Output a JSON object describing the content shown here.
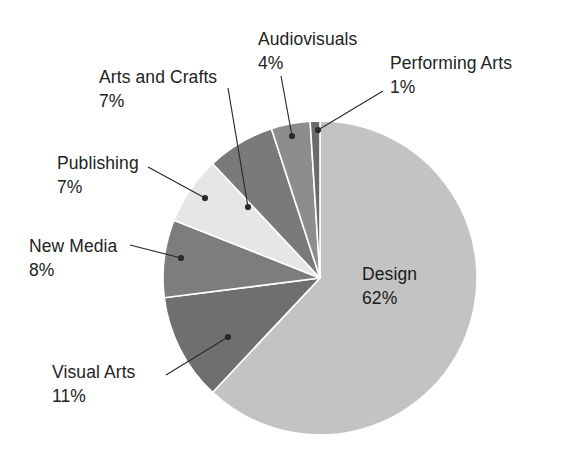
{
  "chart_data": {
    "type": "pie",
    "title": "",
    "subtitle": "",
    "xlabel": "",
    "ylabel": "",
    "legend_position": "none",
    "grid": false,
    "units": "%",
    "start_angle_deg": 0,
    "direction": "clockwise",
    "categories": [
      "Design",
      "Visual Arts",
      "New Media",
      "Publishing",
      "Arts and Crafts",
      "Audiovisuals",
      "Performing Arts"
    ],
    "values": [
      62,
      11,
      8,
      7,
      7,
      4,
      1
    ],
    "slices": [
      {
        "name": "Design",
        "value": 62,
        "label": "Design",
        "pct_label": "62%",
        "color": "#c3c3c3",
        "label_placement": "inside",
        "label_x": 362,
        "label_y": 262,
        "leader": false
      },
      {
        "name": "Visual Arts",
        "value": 11,
        "label": "Visual Arts",
        "pct_label": "11%",
        "color": "#6f6f6f",
        "label_placement": "outside-left",
        "label_x": 52,
        "label_y": 360,
        "leader": true,
        "dot_x": 228,
        "dot_y": 337,
        "elbow_x": 166,
        "elbow_y": 375,
        "text_anchor_x": 161,
        "text_anchor_y": 377
      },
      {
        "name": "New Media",
        "value": 8,
        "label": "New Media",
        "pct_label": "8%",
        "color": "#7d7d7d",
        "label_placement": "outside-left",
        "label_x": 29,
        "label_y": 234,
        "leader": true,
        "dot_x": 181,
        "dot_y": 258,
        "elbow_x": 130,
        "elbow_y": 245,
        "text_anchor_x": 128,
        "text_anchor_y": 245
      },
      {
        "name": "Publishing",
        "value": 7,
        "label": "Publishing",
        "pct_label": "7%",
        "color": "#e6e6e6",
        "label_placement": "outside-left",
        "label_x": 57,
        "label_y": 151,
        "leader": true,
        "dot_x": 205,
        "dot_y": 198,
        "elbow_x": 148,
        "elbow_y": 167,
        "text_anchor_x": 146,
        "text_anchor_y": 166
      },
      {
        "name": "Arts and Crafts",
        "value": 7,
        "label": "Arts and Crafts",
        "pct_label": "7%",
        "color": "#7a7a7a",
        "label_placement": "outside-top-left",
        "label_x": 99,
        "label_y": 65,
        "leader": true,
        "dot_x": 248,
        "dot_y": 207,
        "elbow_x": 228,
        "elbow_y": 88,
        "text_anchor_x": 227,
        "text_anchor_y": 86
      },
      {
        "name": "Audiovisuals",
        "value": 4,
        "label": "Audiovisuals",
        "pct_label": "4%",
        "color": "#8d8d8d",
        "label_placement": "outside-top",
        "label_x": 258,
        "label_y": 27,
        "leader": true,
        "dot_x": 292,
        "dot_y": 136,
        "elbow_x": 281,
        "elbow_y": 76,
        "text_anchor_x": 280,
        "text_anchor_y": 74
      },
      {
        "name": "Performing Arts",
        "value": 1,
        "label": "Performing Arts",
        "pct_label": "1%",
        "color": "#6b6b6b",
        "label_placement": "outside-top-right",
        "label_x": 390,
        "label_y": 51,
        "leader": true,
        "dot_x": 318,
        "dot_y": 130,
        "elbow_x": 383,
        "elbow_y": 91,
        "text_anchor_x": 385,
        "text_anchor_y": 90
      }
    ],
    "geometry": {
      "center_x": 320,
      "center_y": 278,
      "radius": 157
    },
    "style": {
      "background": "#ffffff",
      "text_color": "#232323",
      "leader_color": "#2a2a2a",
      "separator_color": "#ffffff"
    }
  }
}
